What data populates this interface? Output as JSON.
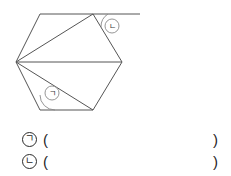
{
  "figure": {
    "name": "hexagon-with-diagonals",
    "stroke_color": "#555555",
    "label_stroke_color": "#8a8a8a",
    "vertices": {
      "left": [
        16,
        62
      ],
      "top_left": [
        40,
        14
      ],
      "top_right": [
        93,
        14
      ],
      "right": [
        122,
        62
      ],
      "bottom_right": [
        93,
        110
      ],
      "bottom_left": [
        40,
        110
      ]
    },
    "extension_line": {
      "from": [
        93,
        14
      ],
      "to": [
        140,
        14
      ],
      "description": "exterior ray extending right from top-right vertex"
    },
    "diagonals": [
      {
        "from": "left",
        "to": "top_right"
      },
      {
        "from": "left",
        "to": "right"
      },
      {
        "from": "left",
        "to": "bottom_right"
      }
    ],
    "angle_marks": [
      {
        "id": "angle-g",
        "label": "ㄱ",
        "at_vertex": "bottom_left",
        "circle_center": [
          52,
          93
        ],
        "circle_radius": 7
      },
      {
        "id": "angle-n",
        "label": "ㄴ",
        "at_vertex": "top_right",
        "circle_center": [
          112,
          26
        ],
        "circle_radius": 7
      }
    ]
  },
  "answers": {
    "rows": [
      {
        "label": "ㄱ",
        "open": "(",
        "value": "",
        "close": ")"
      },
      {
        "label": "ㄴ",
        "open": "(",
        "value": "",
        "close": ")"
      }
    ]
  }
}
